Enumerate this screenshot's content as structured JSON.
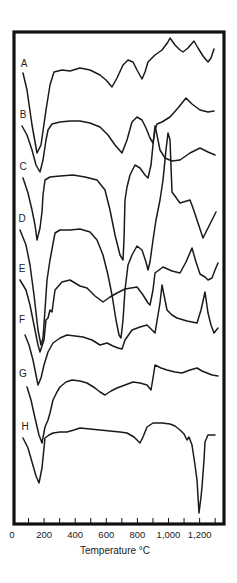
{
  "chart_data": {
    "type": "line",
    "title": "",
    "xlabel": "Temperature °C",
    "ylabel": "",
    "xlim": [
      0,
      1300
    ],
    "x_tick_labels": [
      "0",
      "200",
      "400",
      "600",
      "800",
      "1,000",
      "1,200"
    ],
    "x_tick_values": [
      0,
      200,
      400,
      600,
      800,
      1000,
      1200
    ],
    "minor_tick_step": 100,
    "grid": false,
    "legend": "inline letter labels at left of each curve",
    "series": [
      {
        "name": "A",
        "label_pos": [
          24,
          67
        ],
        "points": [
          [
            23,
            73
          ],
          [
            27,
            90
          ],
          [
            32,
            125
          ],
          [
            37,
            153
          ],
          [
            41,
            145
          ],
          [
            46,
            110
          ],
          [
            50,
            85
          ],
          [
            54,
            72
          ],
          [
            62,
            70
          ],
          [
            70,
            71
          ],
          [
            80,
            68
          ],
          [
            90,
            70
          ],
          [
            100,
            75
          ],
          [
            106,
            80
          ],
          [
            112,
            87
          ],
          [
            117,
            78
          ],
          [
            123,
            65
          ],
          [
            128,
            60
          ],
          [
            133,
            62
          ],
          [
            137,
            70
          ],
          [
            142,
            79
          ],
          [
            145,
            72
          ],
          [
            148,
            62
          ],
          [
            155,
            55
          ],
          [
            162,
            50
          ],
          [
            168,
            42
          ],
          [
            170,
            38
          ],
          [
            175,
            45
          ],
          [
            180,
            50
          ],
          [
            183,
            52
          ],
          [
            188,
            48
          ],
          [
            194,
            41
          ],
          [
            198,
            48
          ],
          [
            203,
            56
          ],
          [
            208,
            62
          ],
          [
            211,
            58
          ],
          [
            214,
            49
          ]
        ]
      },
      {
        "name": "B",
        "label_pos": [
          23,
          118
        ],
        "points": [
          [
            22,
            126
          ],
          [
            27,
            135
          ],
          [
            32,
            150
          ],
          [
            36,
            165
          ],
          [
            40,
            172
          ],
          [
            43,
            160
          ],
          [
            46,
            140
          ],
          [
            48,
            130
          ],
          [
            52,
            124
          ],
          [
            60,
            122
          ],
          [
            70,
            121
          ],
          [
            80,
            121
          ],
          [
            90,
            123
          ],
          [
            100,
            127
          ],
          [
            108,
            135
          ],
          [
            115,
            145
          ],
          [
            122,
            153
          ],
          [
            127,
            140
          ],
          [
            132,
            122
          ],
          [
            137,
            117
          ],
          [
            142,
            120
          ],
          [
            146,
            128
          ],
          [
            150,
            138
          ],
          [
            153,
            143
          ],
          [
            155,
            130
          ],
          [
            157,
            124
          ],
          [
            162,
            122
          ],
          [
            170,
            117
          ],
          [
            178,
            108
          ],
          [
            186,
            98
          ],
          [
            192,
            104
          ],
          [
            200,
            110
          ],
          [
            208,
            112
          ],
          [
            214,
            111
          ]
        ]
      },
      {
        "name": "C",
        "label_pos": [
          23,
          170
        ],
        "points": [
          [
            23,
            178
          ],
          [
            28,
            193
          ],
          [
            32,
            210
          ],
          [
            35,
            225
          ],
          [
            37,
            240
          ],
          [
            40,
            228
          ],
          [
            42,
            212
          ],
          [
            43,
            195
          ],
          [
            45,
            180
          ],
          [
            50,
            177
          ],
          [
            60,
            176
          ],
          [
            73,
            175
          ],
          [
            85,
            177
          ],
          [
            97,
            180
          ],
          [
            105,
            190
          ],
          [
            110,
            210
          ],
          [
            115,
            235
          ],
          [
            120,
            255
          ],
          [
            123,
            260
          ],
          [
            124,
            240
          ],
          [
            125,
            200
          ],
          [
            127,
            187
          ],
          [
            130,
            175
          ],
          [
            135,
            165
          ],
          [
            140,
            168
          ],
          [
            145,
            175
          ],
          [
            148,
            178
          ],
          [
            151,
            165
          ],
          [
            153,
            145
          ],
          [
            155,
            126
          ],
          [
            157,
            135
          ],
          [
            160,
            150
          ],
          [
            165,
            158
          ],
          [
            172,
            161
          ],
          [
            180,
            160
          ],
          [
            190,
            153
          ],
          [
            200,
            148
          ],
          [
            208,
            152
          ],
          [
            215,
            155
          ]
        ]
      },
      {
        "name": "D",
        "label_pos": [
          22,
          222
        ],
        "points": [
          [
            20,
            230
          ],
          [
            26,
            245
          ],
          [
            30,
            265
          ],
          [
            34,
            295
          ],
          [
            38,
            330
          ],
          [
            41,
            345
          ],
          [
            43,
            338
          ],
          [
            45,
            310
          ],
          [
            47,
            280
          ],
          [
            50,
            260
          ],
          [
            55,
            233
          ],
          [
            60,
            230
          ],
          [
            70,
            230
          ],
          [
            80,
            229
          ],
          [
            90,
            232
          ],
          [
            97,
            240
          ],
          [
            103,
            255
          ],
          [
            108,
            275
          ],
          [
            112,
            295
          ],
          [
            116,
            320
          ],
          [
            119,
            335
          ],
          [
            121,
            338
          ],
          [
            123,
            320
          ],
          [
            125,
            290
          ],
          [
            128,
            265
          ],
          [
            132,
            255
          ],
          [
            137,
            246
          ],
          [
            142,
            250
          ],
          [
            146,
            262
          ],
          [
            148,
            270
          ],
          [
            150,
            262
          ],
          [
            153,
            240
          ],
          [
            156,
            220
          ],
          [
            160,
            200
          ],
          [
            163,
            180
          ],
          [
            166,
            150
          ],
          [
            168,
            133
          ],
          [
            170,
            140
          ],
          [
            172,
            192
          ],
          [
            180,
            203
          ],
          [
            190,
            200
          ],
          [
            193,
            208
          ],
          [
            203,
            238
          ],
          [
            207,
            230
          ],
          [
            216,
            212
          ]
        ]
      },
      {
        "name": "E",
        "label_pos": [
          22,
          272
        ],
        "points": [
          [
            20,
            280
          ],
          [
            26,
            290
          ],
          [
            30,
            305
          ],
          [
            34,
            325
          ],
          [
            38,
            345
          ],
          [
            40,
            352
          ],
          [
            44,
            340
          ],
          [
            46,
            320
          ],
          [
            48,
            318
          ],
          [
            50,
            310
          ],
          [
            52,
            312
          ],
          [
            55,
            290
          ],
          [
            62,
            282
          ],
          [
            70,
            280
          ],
          [
            80,
            286
          ],
          [
            87,
            288
          ],
          [
            95,
            296
          ],
          [
            103,
            302
          ],
          [
            110,
            297
          ],
          [
            117,
            293
          ],
          [
            125,
            289
          ],
          [
            137,
            287
          ],
          [
            143,
            295
          ],
          [
            148,
            303
          ],
          [
            150,
            305
          ],
          [
            153,
            290
          ],
          [
            155,
            273
          ],
          [
            163,
            267
          ],
          [
            172,
            271
          ],
          [
            180,
            273
          ],
          [
            186,
            262
          ],
          [
            192,
            248
          ],
          [
            196,
            262
          ],
          [
            200,
            274
          ],
          [
            205,
            277
          ],
          [
            208,
            280
          ],
          [
            212,
            278
          ],
          [
            215,
            270
          ],
          [
            218,
            263
          ]
        ]
      },
      {
        "name": "F",
        "label_pos": [
          22,
          323
        ],
        "points": [
          [
            25,
            335
          ],
          [
            29,
            345
          ],
          [
            33,
            360
          ],
          [
            36,
            375
          ],
          [
            38,
            385
          ],
          [
            41,
            378
          ],
          [
            44,
            365
          ],
          [
            48,
            352
          ],
          [
            53,
            343
          ],
          [
            60,
            338
          ],
          [
            67,
            335
          ],
          [
            75,
            336
          ],
          [
            83,
            337
          ],
          [
            92,
            340
          ],
          [
            100,
            345
          ],
          [
            107,
            343
          ],
          [
            113,
            346
          ],
          [
            118,
            348
          ],
          [
            122,
            349
          ],
          [
            125,
            340
          ],
          [
            132,
            330
          ],
          [
            140,
            327
          ],
          [
            147,
            325
          ],
          [
            152,
            330
          ],
          [
            155,
            333
          ],
          [
            158,
            315
          ],
          [
            160,
            303
          ],
          [
            162,
            285
          ],
          [
            164,
            295
          ],
          [
            167,
            310
          ],
          [
            172,
            315
          ],
          [
            177,
            318
          ],
          [
            187,
            321
          ],
          [
            197,
            323
          ],
          [
            201,
            310
          ],
          [
            205,
            292
          ],
          [
            208,
            313
          ],
          [
            211,
            325
          ],
          [
            214,
            333
          ],
          [
            218,
            328
          ]
        ]
      },
      {
        "name": "G",
        "label_pos": [
          23,
          377
        ],
        "points": [
          [
            27,
            387
          ],
          [
            31,
            400
          ],
          [
            35,
            418
          ],
          [
            39,
            435
          ],
          [
            42,
            443
          ],
          [
            45,
            427
          ],
          [
            48,
            420
          ],
          [
            50,
            413
          ],
          [
            53,
            400
          ],
          [
            57,
            392
          ],
          [
            60,
            387
          ],
          [
            66,
            382
          ],
          [
            72,
            380
          ],
          [
            80,
            381
          ],
          [
            87,
            383
          ],
          [
            95,
            388
          ],
          [
            100,
            392
          ],
          [
            105,
            395
          ],
          [
            111,
            391
          ],
          [
            117,
            388
          ],
          [
            125,
            385
          ],
          [
            133,
            382
          ],
          [
            140,
            383
          ],
          [
            147,
            385
          ],
          [
            151,
            390
          ],
          [
            153,
            378
          ],
          [
            155,
            365
          ],
          [
            161,
            368
          ],
          [
            167,
            370
          ],
          [
            175,
            372
          ],
          [
            182,
            373
          ],
          [
            190,
            370
          ],
          [
            197,
            368
          ],
          [
            202,
            371
          ],
          [
            207,
            373
          ],
          [
            212,
            375
          ],
          [
            218,
            376
          ]
        ]
      },
      {
        "name": "H",
        "label_pos": [
          25,
          430
        ],
        "points": [
          [
            23,
            438
          ],
          [
            28,
            448
          ],
          [
            32,
            462
          ],
          [
            36,
            476
          ],
          [
            39,
            483
          ],
          [
            42,
            468
          ],
          [
            45,
            438
          ],
          [
            49,
            435
          ],
          [
            53,
            433
          ],
          [
            60,
            432
          ],
          [
            67,
            432
          ],
          [
            74,
            430
          ],
          [
            80,
            428
          ],
          [
            90,
            429
          ],
          [
            100,
            430
          ],
          [
            110,
            431
          ],
          [
            120,
            432
          ],
          [
            127,
            433
          ],
          [
            134,
            437
          ],
          [
            140,
            443
          ],
          [
            143,
            437
          ],
          [
            147,
            427
          ],
          [
            153,
            423
          ],
          [
            162,
            423
          ],
          [
            170,
            424
          ],
          [
            175,
            426
          ],
          [
            180,
            430
          ],
          [
            184,
            434
          ],
          [
            187,
            440
          ],
          [
            189,
            437
          ],
          [
            192,
            445
          ],
          [
            195,
            465
          ],
          [
            197,
            480
          ],
          [
            199,
            513
          ],
          [
            201,
            497
          ],
          [
            202,
            487
          ],
          [
            204,
            460
          ],
          [
            205,
            442
          ],
          [
            208,
            435
          ],
          [
            212,
            435
          ],
          [
            215,
            435
          ]
        ]
      }
    ]
  },
  "labels": {
    "x_axis_title": "Temperature °C"
  }
}
